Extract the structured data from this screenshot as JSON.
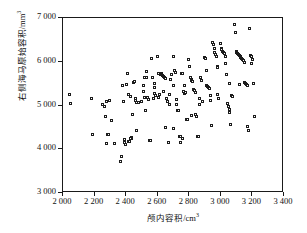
{
  "chart_data": {
    "type": "scatter",
    "title": "",
    "xlabel": "颅内容积/cm³",
    "ylabel": "右侧海马原始容积/mm³",
    "xlim": [
      2000,
      3400
    ],
    "ylim": [
      3000,
      7000
    ],
    "xticks": [
      2000,
      2200,
      2400,
      2600,
      2800,
      3000,
      3200,
      3400
    ],
    "xtick_labels": [
      "2 000",
      "2 200",
      "2 400",
      "2 600",
      "2 800",
      "3 000",
      "3 200",
      "3 400"
    ],
    "yticks": [
      3000,
      4000,
      5000,
      6000,
      7000
    ],
    "ytick_labels": [
      "3 000",
      "4 000",
      "5 000",
      "6 000",
      "7 000"
    ],
    "grid": false,
    "legend": null,
    "marker": "open-square",
    "marker_color": "#1c1c1c",
    "marker_fill": "#ffffff",
    "points": [
      [
        2045,
        5250
      ],
      [
        2050,
        5030
      ],
      [
        2185,
        5160
      ],
      [
        2190,
        4330
      ],
      [
        2255,
        5020
      ],
      [
        2265,
        4960
      ],
      [
        2275,
        4740
      ],
      [
        2280,
        4120
      ],
      [
        2285,
        4320
      ],
      [
        2290,
        4330
      ],
      [
        2295,
        5110
      ],
      [
        2310,
        4640
      ],
      [
        2370,
        3700
      ],
      [
        2375,
        3830
      ],
      [
        2380,
        5440
      ],
      [
        2385,
        5090
      ],
      [
        2390,
        4140
      ],
      [
        2395,
        4220
      ],
      [
        2400,
        4090
      ],
      [
        2405,
        5460
      ],
      [
        2410,
        5720
      ],
      [
        2415,
        5230
      ],
      [
        2420,
        4170
      ],
      [
        2425,
        4160
      ],
      [
        2430,
        5200
      ],
      [
        2435,
        4240
      ],
      [
        2440,
        4250
      ],
      [
        2445,
        4790
      ],
      [
        2450,
        5520
      ],
      [
        2455,
        5540
      ],
      [
        2460,
        5140
      ],
      [
        2465,
        5110
      ],
      [
        2470,
        4410
      ],
      [
        2480,
        5060
      ],
      [
        2500,
        5080
      ],
      [
        2510,
        5450
      ],
      [
        2515,
        5310
      ],
      [
        2520,
        5170
      ],
      [
        2525,
        4880
      ],
      [
        2530,
        5620
      ],
      [
        2535,
        5760
      ],
      [
        2540,
        5170
      ],
      [
        2545,
        5120
      ],
      [
        2550,
        4190
      ],
      [
        2555,
        4190
      ],
      [
        2560,
        4200
      ],
      [
        2565,
        6070
      ],
      [
        2570,
        5640
      ],
      [
        2575,
        5150
      ],
      [
        2580,
        5490
      ],
      [
        2585,
        5270
      ],
      [
        2590,
        5210
      ],
      [
        2600,
        6110
      ],
      [
        2605,
        5730
      ],
      [
        2610,
        5170
      ],
      [
        2615,
        5250
      ],
      [
        2620,
        5690
      ],
      [
        2625,
        5720
      ],
      [
        2630,
        5700
      ],
      [
        2635,
        5680
      ],
      [
        2640,
        5660
      ],
      [
        2645,
        5640
      ],
      [
        2650,
        5610
      ],
      [
        2655,
        4490
      ],
      [
        2660,
        5160
      ],
      [
        2665,
        5080
      ],
      [
        2670,
        4140
      ],
      [
        2675,
        5010
      ],
      [
        2680,
        5230
      ],
      [
        2685,
        5590
      ],
      [
        2690,
        5690
      ],
      [
        2700,
        6110
      ],
      [
        2705,
        5450
      ],
      [
        2710,
        5800
      ],
      [
        2715,
        5750
      ],
      [
        2720,
        5130
      ],
      [
        2725,
        5010
      ],
      [
        2730,
        4880
      ],
      [
        2735,
        4870
      ],
      [
        2740,
        4280
      ],
      [
        2745,
        4290
      ],
      [
        2750,
        4150
      ],
      [
        2755,
        5720
      ],
      [
        2760,
        5710
      ],
      [
        2765,
        5300
      ],
      [
        2770,
        5260
      ],
      [
        2775,
        5440
      ],
      [
        2780,
        5290
      ],
      [
        2785,
        4680
      ],
      [
        2790,
        4670
      ],
      [
        2800,
        6030
      ],
      [
        2805,
        5880
      ],
      [
        2810,
        5620
      ],
      [
        2815,
        5580
      ],
      [
        2820,
        5560
      ],
      [
        2825,
        5540
      ],
      [
        2830,
        5350
      ],
      [
        2835,
        5330
      ],
      [
        2840,
        5280
      ],
      [
        2845,
        4780
      ],
      [
        2850,
        4740
      ],
      [
        2855,
        4270
      ],
      [
        2860,
        4280
      ],
      [
        2865,
        5150
      ],
      [
        2870,
        5020
      ],
      [
        2875,
        5620
      ],
      [
        2880,
        5560
      ],
      [
        2900,
        6090
      ],
      [
        2905,
        6060
      ],
      [
        2910,
        5800
      ],
      [
        2915,
        5450
      ],
      [
        2920,
        5420
      ],
      [
        2925,
        5400
      ],
      [
        2930,
        5380
      ],
      [
        2935,
        5210
      ],
      [
        2940,
        5100
      ],
      [
        2945,
        4540
      ],
      [
        2950,
        6420
      ],
      [
        2955,
        6390
      ],
      [
        2960,
        6300
      ],
      [
        2965,
        6210
      ],
      [
        2970,
        6150
      ],
      [
        2975,
        6120
      ],
      [
        2980,
        5890
      ],
      [
        2985,
        5860
      ],
      [
        2990,
        5150
      ],
      [
        3000,
        6400
      ],
      [
        3005,
        6290
      ],
      [
        3010,
        6270
      ],
      [
        3015,
        6230
      ],
      [
        3020,
        6210
      ],
      [
        3025,
        6180
      ],
      [
        3030,
        6120
      ],
      [
        3035,
        5950
      ],
      [
        3040,
        5700
      ],
      [
        3045,
        5030
      ],
      [
        3050,
        4960
      ],
      [
        3055,
        4890
      ],
      [
        3060,
        4830
      ],
      [
        3065,
        4560
      ],
      [
        3070,
        5220
      ],
      [
        3075,
        5190
      ],
      [
        3090,
        6830
      ],
      [
        3095,
        6660
      ],
      [
        3100,
        6230
      ],
      [
        3105,
        6210
      ],
      [
        3110,
        6180
      ],
      [
        3115,
        6150
      ],
      [
        3120,
        6130
      ],
      [
        3125,
        6100
      ],
      [
        3130,
        6080
      ],
      [
        3135,
        6060
      ],
      [
        3140,
        6030
      ],
      [
        3145,
        6010
      ],
      [
        3150,
        5980
      ],
      [
        3155,
        5520
      ],
      [
        3160,
        5490
      ],
      [
        3165,
        5470
      ],
      [
        3170,
        5450
      ],
      [
        3175,
        4510
      ],
      [
        3180,
        4420
      ],
      [
        3185,
        6760
      ],
      [
        3190,
        6140
      ],
      [
        3195,
        6110
      ],
      [
        3200,
        5960
      ],
      [
        3205,
        6040
      ],
      [
        3210,
        5500
      ],
      [
        3215,
        4740
      ],
      [
        3120,
        5470
      ],
      [
        3060,
        5490
      ],
      [
        2980,
        5250
      ],
      [
        2890,
        5080
      ],
      [
        2820,
        4770
      ],
      [
        2760,
        4240
      ],
      [
        2700,
        4460
      ],
      [
        2640,
        5300
      ],
      [
        2580,
        5390
      ],
      [
        2520,
        5640
      ],
      [
        2470,
        5060
      ],
      [
        2430,
        4230
      ],
      [
        2330,
        4110
      ],
      [
        2280,
        5090
      ]
    ]
  }
}
